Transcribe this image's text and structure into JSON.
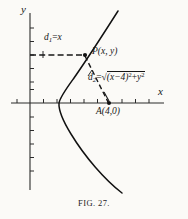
{
  "figure": {
    "caption": "FIG. 27.",
    "axes": {
      "x_label": "x",
      "y_label": "y",
      "x_axis_y_px": 103,
      "y_axis_x_px": 30,
      "tick_spacing_px": 13.5,
      "tick_len_px": 4
    },
    "labels": {
      "d1": {
        "name": "d",
        "sub": "1",
        "eq": "=",
        "rhs": "x",
        "full": "d₁ = x"
      },
      "point_p": {
        "full": "P(x, y)"
      },
      "d2": {
        "name": "d",
        "sub": "2",
        "eq": "=",
        "radicand_a": "(x−4)",
        "radicand_a_sup": "2",
        "plus": "+",
        "radicand_b": "y",
        "radicand_b_sup": "2",
        "full": "d₂ = √((x−4)²+y²)"
      },
      "point_a": {
        "full": "A(4,0)"
      }
    },
    "geometry": {
      "curve_type": "parabola",
      "opens": "left",
      "vertex_px": [
        59,
        103
      ],
      "point_p_px": [
        85,
        55
      ],
      "point_a_px": [
        109,
        103
      ],
      "dashed_h_line_px": [
        30,
        55,
        85,
        55
      ],
      "dashed_slant_line_px": [
        85,
        55,
        109,
        103
      ],
      "curve_top_end_px": [
        118,
        11
      ],
      "curve_bottom_end_px": [
        122,
        193
      ]
    },
    "colors": {
      "ink": "#171717",
      "paper": "#fbfaf7",
      "axis": "#2b2b2b",
      "curve": "#111111"
    }
  }
}
